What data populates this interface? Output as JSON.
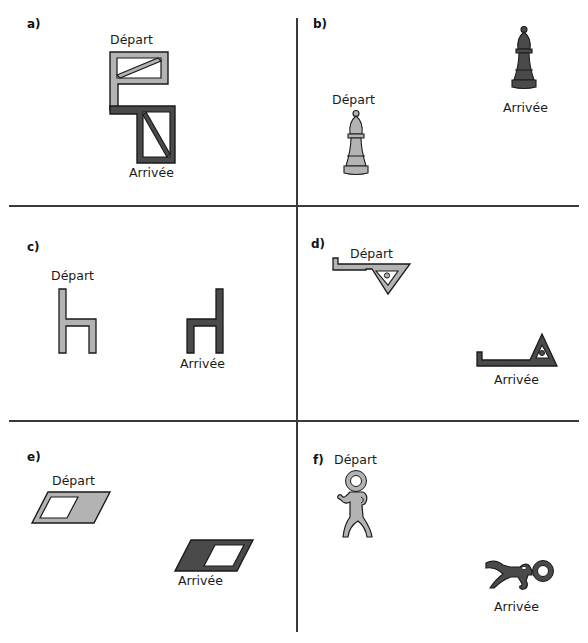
{
  "colors": {
    "start_fill": "#b3b3b3",
    "end_fill": "#4a4a4a",
    "outline": "#1a1a1a",
    "divider": "#3a3a3a"
  },
  "panels": [
    {
      "id": "a",
      "label": "a)",
      "start_label": "Départ",
      "end_label": "Arrivée",
      "figure": "rectangle-with-diagonal"
    },
    {
      "id": "b",
      "label": "b)",
      "start_label": "Départ",
      "end_label": "Arrivée",
      "figure": "chess-bishop"
    },
    {
      "id": "c",
      "label": "c)",
      "start_label": "Départ",
      "end_label": "Arrivée",
      "figure": "chair-h-shape"
    },
    {
      "id": "d",
      "label": "d)",
      "start_label": "Départ",
      "end_label": "Arrivée",
      "figure": "triangle-with-bar"
    },
    {
      "id": "e",
      "label": "e)",
      "start_label": "Départ",
      "end_label": "Arrivée",
      "figure": "parallelogram-with-window"
    },
    {
      "id": "f",
      "label": "f)",
      "start_label": "Départ",
      "end_label": "Arrivée",
      "figure": "stick-figure"
    }
  ]
}
